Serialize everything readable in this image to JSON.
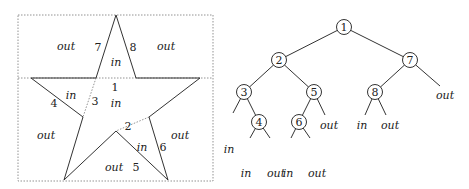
{
  "star_figure": {
    "region_labels": [
      {
        "text": "out",
        "x": 66,
        "y": 47,
        "italic": true
      },
      {
        "text": "out",
        "x": 166,
        "y": 47,
        "italic": true
      },
      {
        "text": "in",
        "x": 116,
        "y": 63,
        "italic": true
      },
      {
        "text": "in",
        "x": 71,
        "y": 96,
        "italic": true
      },
      {
        "text": "in",
        "x": 116,
        "y": 104,
        "italic": true
      },
      {
        "text": "out",
        "x": 46,
        "y": 136,
        "italic": true
      },
      {
        "text": "in",
        "x": 142,
        "y": 148,
        "italic": true
      },
      {
        "text": "out",
        "x": 180,
        "y": 136,
        "italic": true
      },
      {
        "text": "out",
        "x": 114,
        "y": 168,
        "italic": true
      }
    ],
    "edge_labels": [
      {
        "text": "7",
        "x": 98,
        "y": 48
      },
      {
        "text": "8",
        "x": 133,
        "y": 48
      },
      {
        "text": "1",
        "x": 115,
        "y": 88
      },
      {
        "text": "3",
        "x": 95,
        "y": 102
      },
      {
        "text": "4",
        "x": 54,
        "y": 104
      },
      {
        "text": "2",
        "x": 128,
        "y": 127
      },
      {
        "text": "6",
        "x": 163,
        "y": 148
      },
      {
        "text": "5",
        "x": 136,
        "y": 168
      }
    ]
  },
  "tree": {
    "nodes": [
      {
        "id": "1",
        "label": "1",
        "x": 344,
        "y": 27
      },
      {
        "id": "2",
        "label": "2",
        "x": 279,
        "y": 60
      },
      {
        "id": "7",
        "label": "7",
        "x": 410,
        "y": 60
      },
      {
        "id": "3",
        "label": "3",
        "x": 244,
        "y": 92
      },
      {
        "id": "5",
        "label": "5",
        "x": 314,
        "y": 92
      },
      {
        "id": "8",
        "label": "8",
        "x": 375,
        "y": 92
      },
      {
        "id": "4",
        "label": "4",
        "x": 259,
        "y": 122
      },
      {
        "id": "6",
        "label": "6",
        "x": 299,
        "y": 122
      }
    ],
    "leaves": [
      {
        "text": "out",
        "x": 445,
        "y": 96
      },
      {
        "text": "in",
        "x": 229,
        "y": 150
      },
      {
        "text": "out",
        "x": 329,
        "y": 126
      },
      {
        "text": "in",
        "x": 362,
        "y": 126
      },
      {
        "text": "out",
        "x": 390,
        "y": 126
      },
      {
        "text": "in",
        "x": 246,
        "y": 174
      },
      {
        "text": "out",
        "x": 276,
        "y": 174
      },
      {
        "text": "in",
        "x": 288,
        "y": 174
      },
      {
        "text": "out",
        "x": 317,
        "y": 174
      }
    ]
  }
}
